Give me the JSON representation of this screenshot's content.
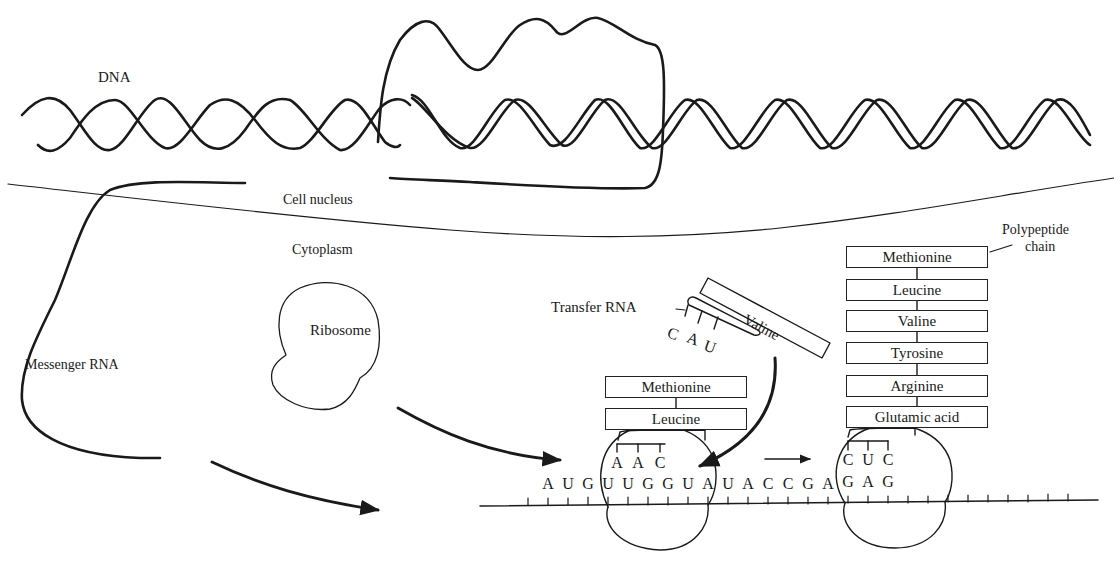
{
  "labels": {
    "dna": "DNA",
    "cell_nucleus": "Cell nucleus",
    "cytoplasm": "Cytoplasm",
    "ribosome": "Ribosome",
    "messenger_rna": "Messenger RNA",
    "transfer_rna": "Transfer RNA",
    "polypeptide_line1": "Polypeptide",
    "polypeptide_line2": "chain"
  },
  "trna_free": {
    "amino_acid": "Valine",
    "anticodon": [
      "C",
      "A",
      "U"
    ]
  },
  "ribosome_1": {
    "chain": [
      "Methionine",
      "Leucine"
    ],
    "anticodon": [
      "A",
      "A",
      "C"
    ]
  },
  "ribosome_2": {
    "chain": [
      "Methionine",
      "Leucine",
      "Valine",
      "Tyrosine",
      "Arginine",
      "Glutamic acid"
    ],
    "anticodon": [
      "C",
      "U",
      "C"
    ]
  },
  "mrna_sequence_1": [
    "A",
    "U",
    "G",
    "U",
    "U",
    "G",
    "G",
    "U",
    "A",
    "U",
    "A",
    "C",
    "C",
    "G",
    "A"
  ],
  "mrna_sequence_2": [
    "G",
    "A",
    "G"
  ],
  "colors": {
    "ink": "#1a1a1a",
    "background": "#ffffff"
  }
}
